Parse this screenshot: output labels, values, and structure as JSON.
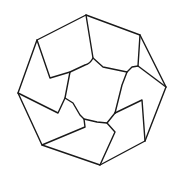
{
  "diagram": {
    "type": "geometric-line-drawing",
    "stroke_color": "#1a1a1a",
    "background": "#ffffff",
    "outer_octagon": [
      [
        86,
        15
      ],
      [
        140,
        35
      ],
      [
        166,
        87
      ],
      [
        145,
        141
      ],
      [
        100,
        165
      ],
      [
        42,
        145
      ],
      [
        18,
        93
      ],
      [
        37,
        40
      ]
    ],
    "inner_paths": [
      "M86,15 L93,58 Q90,64 85,65 L70,72 L50,78 L37,40",
      "M93,58 L103,67 L127,72 L132,67 L138,66 L140,35",
      "M138,66 L166,87",
      "M127,72 L122,85 L115,113",
      "M115,113 L142,100 L145,141",
      "M115,113 L107,123 L115,132 L100,165",
      "M107,123 L97,122 L84,119 L80,115 L73,103 L65,98 L70,72",
      "M65,98 L58,113 L18,93",
      "M84,119 L85,127 L42,145"
    ]
  }
}
